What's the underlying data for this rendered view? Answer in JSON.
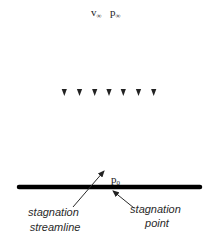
{
  "diagram": {
    "freestream_velocity_label": "v",
    "freestream_velocity_sub": "∞",
    "freestream_pressure_label": "p",
    "freestream_pressure_sub": "∞",
    "stagnation_pressure_label": "p",
    "stagnation_pressure_sub": "0",
    "streamline_count": 7,
    "flow_direction": "downward",
    "labels": {
      "stagnation_streamline": [
        "stagnation",
        "streamline"
      ],
      "stagnation_point": [
        "stagnation",
        "point"
      ]
    },
    "colors": {
      "line": "#3a3a3a",
      "wall": "#000000",
      "text": "#222222"
    }
  }
}
